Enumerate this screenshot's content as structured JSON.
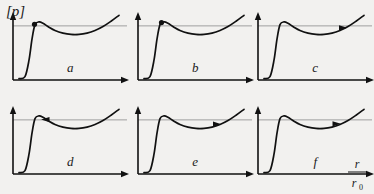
{
  "figure": {
    "y_axis_label": "[p]",
    "x_axis_label_numerator": "r",
    "x_axis_label_denominator": "r",
    "x_axis_label_denominator_sub": "0",
    "background_color": "#f2f1ef",
    "curve_color": "#111111",
    "axis_color": "#111111",
    "reference_line_color": "#8a8a8a"
  },
  "chart_data": {
    "type": "line",
    "title": "",
    "subtitle": "",
    "xlabel": "r/r_0",
    "ylabel": "[p]",
    "grid": false,
    "legend_position": "none",
    "axis_ranges": {
      "x": [
        0,
        1
      ],
      "y": [
        0,
        1
      ]
    },
    "shared_description": "Six schematic plots of reduced pressure [p] versus reduced radius r/r0. Each curve rises steeply from the baseline, reaches a local maximum near the horizontal reference line, passes through a shallow minimum, then rises again. A marker advances along the curve from panel a to panel f.",
    "reference_line_value": 0.82,
    "x": [
      0.0,
      0.06,
      0.1,
      0.13,
      0.16,
      0.2,
      0.24,
      0.3,
      0.36,
      0.44,
      0.52,
      0.6,
      0.68,
      0.76,
      0.84,
      0.92,
      1.0
    ],
    "panels": [
      {
        "label": "a",
        "marker_type": "dot",
        "marker_x": 0.155,
        "marker_y": 0.845,
        "values": [
          0.02,
          0.05,
          0.3,
          0.62,
          0.84,
          0.88,
          0.86,
          0.8,
          0.75,
          0.71,
          0.69,
          0.69,
          0.71,
          0.75,
          0.81,
          0.89,
          0.98
        ]
      },
      {
        "label": "b",
        "marker_type": "dot",
        "marker_x": 0.175,
        "marker_y": 0.87,
        "values": [
          0.02,
          0.05,
          0.3,
          0.62,
          0.84,
          0.88,
          0.86,
          0.8,
          0.75,
          0.71,
          0.69,
          0.69,
          0.71,
          0.75,
          0.81,
          0.89,
          0.98
        ]
      },
      {
        "label": "c",
        "marker_type": "arrow-right",
        "marker_x": 0.8,
        "marker_y": 0.79,
        "values": [
          0.02,
          0.05,
          0.3,
          0.62,
          0.84,
          0.88,
          0.86,
          0.8,
          0.75,
          0.71,
          0.69,
          0.69,
          0.71,
          0.75,
          0.81,
          0.89,
          0.98
        ]
      },
      {
        "label": "d",
        "marker_type": "arrow-left",
        "marker_x": 0.255,
        "marker_y": 0.825,
        "values": [
          0.02,
          0.05,
          0.3,
          0.62,
          0.84,
          0.88,
          0.86,
          0.8,
          0.75,
          0.71,
          0.69,
          0.69,
          0.71,
          0.75,
          0.81,
          0.89,
          0.98
        ]
      },
      {
        "label": "e",
        "marker_type": "arrow-right",
        "marker_x": 0.74,
        "marker_y": 0.755,
        "values": [
          0.02,
          0.05,
          0.3,
          0.62,
          0.84,
          0.88,
          0.86,
          0.8,
          0.75,
          0.71,
          0.69,
          0.69,
          0.71,
          0.75,
          0.81,
          0.89,
          0.98
        ]
      },
      {
        "label": "f",
        "marker_type": "arrow-right",
        "marker_x": 0.735,
        "marker_y": 0.76,
        "values": [
          0.02,
          0.05,
          0.3,
          0.62,
          0.84,
          0.88,
          0.86,
          0.8,
          0.75,
          0.71,
          0.69,
          0.69,
          0.71,
          0.75,
          0.81,
          0.89,
          0.98
        ]
      }
    ]
  }
}
